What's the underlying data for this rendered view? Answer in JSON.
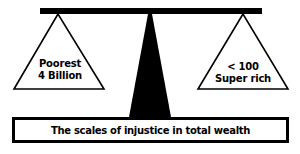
{
  "diagram": {
    "title": "The scales of injustice in total wealth",
    "left_pan": {
      "line1": "Poorest",
      "line2": "4 Billion"
    },
    "right_pan": {
      "line1": "< 100",
      "line2": "Super rich"
    },
    "colors": {
      "ink": "#000000",
      "background": "#ffffff"
    }
  }
}
